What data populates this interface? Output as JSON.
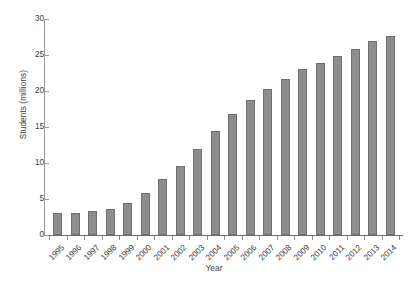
{
  "chart_data": {
    "type": "bar",
    "title": "",
    "xlabel": "Year",
    "ylabel": "Students (millions)",
    "categories": [
      "1995",
      "1996",
      "1997",
      "1998",
      "1999",
      "2000",
      "2001",
      "2002",
      "2003",
      "2004",
      "2005",
      "2006",
      "2007",
      "2008",
      "2009",
      "2010",
      "2011",
      "2012",
      "2013",
      "2014"
    ],
    "values": [
      3.0,
      3.1,
      3.3,
      3.6,
      4.4,
      5.9,
      7.8,
      9.6,
      11.9,
      14.4,
      16.8,
      18.7,
      20.3,
      21.7,
      23.0,
      23.9,
      24.8,
      25.9,
      26.9,
      27.6
    ],
    "ylim": [
      0,
      30
    ],
    "yticks": [
      0,
      5,
      10,
      15,
      20,
      25,
      30
    ],
    "ytick_labels": [
      "0",
      "5",
      "10",
      "15",
      "20",
      "25",
      "30"
    ],
    "grid": false,
    "legend": null,
    "bar_color": "#8d8d8d",
    "bar_edge_color": "#6f6f6f",
    "axis_color": "#8f8f8f"
  }
}
